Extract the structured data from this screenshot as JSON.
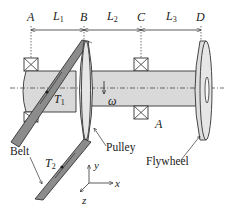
{
  "diagram": {
    "type": "shaft-pulley-flywheel assembly",
    "points": {
      "A": "A",
      "B": "B",
      "C": "C",
      "D": "D"
    },
    "lengths": {
      "L1": {
        "base": "L",
        "sub": "1"
      },
      "L2": {
        "base": "L",
        "sub": "2"
      },
      "L3": {
        "base": "L",
        "sub": "3"
      }
    },
    "forces": {
      "T1": {
        "base": "T",
        "sub": "1"
      },
      "T2": {
        "base": "T",
        "sub": "2"
      }
    },
    "rotation": "ω",
    "section_label": "A",
    "components": {
      "pulley": "Pulley",
      "flywheel": "Flywheel",
      "belt": "Belt"
    },
    "axes": {
      "x": "x",
      "y": "y",
      "z": "z"
    },
    "colors": {
      "shaft": "#d9d9d9",
      "belt": "#8c8c8c",
      "disc": "#e2e2e2",
      "outline": "#333333"
    }
  }
}
